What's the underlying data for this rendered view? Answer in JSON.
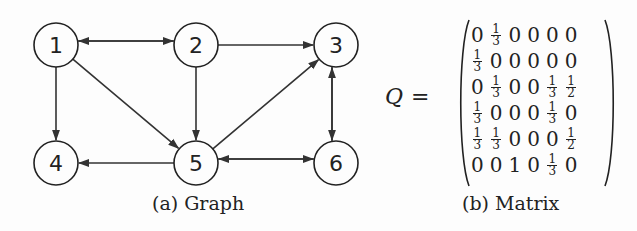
{
  "figure": {
    "graph": {
      "caption": "(a) Graph",
      "nodes": [
        {
          "id": "1",
          "label": "1",
          "x": 56,
          "y": 45
        },
        {
          "id": "2",
          "label": "2",
          "x": 196,
          "y": 45
        },
        {
          "id": "3",
          "label": "3",
          "x": 336,
          "y": 45
        },
        {
          "id": "4",
          "label": "4",
          "x": 56,
          "y": 163
        },
        {
          "id": "5",
          "label": "5",
          "x": 196,
          "y": 163
        },
        {
          "id": "6",
          "label": "6",
          "x": 336,
          "y": 163
        }
      ],
      "edges": [
        {
          "from": "1",
          "to": "2",
          "offset": -4
        },
        {
          "from": "2",
          "to": "1",
          "offset": -4
        },
        {
          "from": "2",
          "to": "3",
          "offset": 0
        },
        {
          "from": "1",
          "to": "4",
          "offset": 0
        },
        {
          "from": "1",
          "to": "5",
          "offset": 0
        },
        {
          "from": "2",
          "to": "5",
          "offset": 0
        },
        {
          "from": "5",
          "to": "3",
          "offset": 0
        },
        {
          "from": "3",
          "to": "6",
          "offset": 4
        },
        {
          "from": "6",
          "to": "3",
          "offset": 4
        },
        {
          "from": "5",
          "to": "4",
          "offset": 0
        },
        {
          "from": "5",
          "to": "6",
          "offset": -4
        },
        {
          "from": "6",
          "to": "5",
          "offset": -4
        }
      ]
    },
    "matrix": {
      "caption": "(b) Matrix",
      "symbol": "Q",
      "equals": "=",
      "rows": [
        [
          "0",
          "1/3",
          "0",
          "0",
          "0",
          "0"
        ],
        [
          "1/3",
          "0",
          "0",
          "0",
          "0",
          "0"
        ],
        [
          "0",
          "1/3",
          "0",
          "0",
          "1/3",
          "1/2"
        ],
        [
          "1/3",
          "0",
          "0",
          "0",
          "1/3",
          "0"
        ],
        [
          "1/3",
          "1/3",
          "0",
          "0",
          "0",
          "1/2"
        ],
        [
          "0",
          "0",
          "1",
          "0",
          "1/3",
          "0"
        ]
      ]
    }
  }
}
